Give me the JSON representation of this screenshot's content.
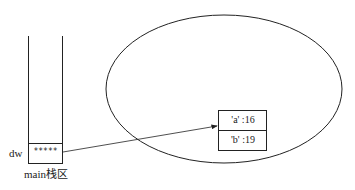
{
  "stack": {
    "label": "main栈区",
    "variable_name": "dw",
    "cell_value": "*****"
  },
  "heap": {
    "object_fields": [
      {
        "text": "'a' :16"
      },
      {
        "text": "'b' :19"
      }
    ]
  },
  "colors": {
    "line": "#222222",
    "background": "#ffffff"
  }
}
